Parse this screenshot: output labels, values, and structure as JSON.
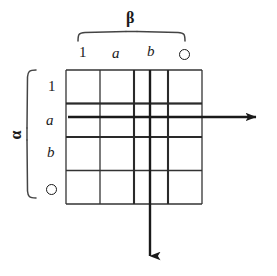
{
  "figure": {
    "type": "cayley-table-diagram",
    "background_color": "#ffffff",
    "ink_color": "#1a1a1a",
    "column_axis": {
      "symbol": "β",
      "name": "beta",
      "brace_orientation": "top",
      "labels": [
        "1",
        "a",
        "b",
        "O"
      ]
    },
    "row_axis": {
      "symbol": "α",
      "name": "alpha",
      "brace_orientation": "left",
      "rotated": true,
      "labels": [
        "1",
        "a",
        "b",
        "O"
      ]
    },
    "grid": {
      "rows": 4,
      "columns": 4,
      "left": 66,
      "top": 70,
      "right": 202,
      "bottom": 204,
      "cell_width": 34,
      "cell_height": 33.5,
      "cells": [
        [
          "",
          "",
          "",
          ""
        ],
        [
          "",
          "",
          "",
          ""
        ],
        [
          "",
          "",
          "",
          ""
        ],
        [
          "",
          "",
          "",
          ""
        ]
      ]
    },
    "highlight_arrows": [
      {
        "name": "row-arrow",
        "direction": "right",
        "highlights_label": "a",
        "axis": "row",
        "y": 117,
        "x_start": 68,
        "x_end": 262
      },
      {
        "name": "column-arrow",
        "direction": "down",
        "highlights_label": "b",
        "axis": "column",
        "x": 150,
        "y_start": 70,
        "y_end": 262
      }
    ]
  }
}
